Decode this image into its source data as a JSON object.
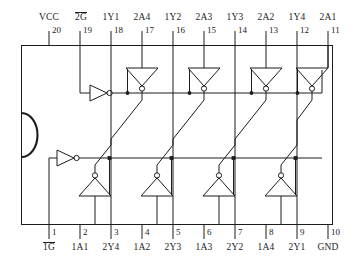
{
  "diagram": {
    "caption": "",
    "package": {
      "notch_name": "pin-1-notch",
      "outline_color": "#1c1c1c"
    }
  },
  "top_pins": [
    {
      "label": "VCC",
      "number": "20",
      "overbar": false
    },
    {
      "label": "2G",
      "number": "19",
      "overbar": true
    },
    {
      "label": "1Y1",
      "number": "18",
      "overbar": false
    },
    {
      "label": "2A4",
      "number": "17",
      "overbar": false
    },
    {
      "label": "1Y2",
      "number": "16",
      "overbar": false
    },
    {
      "label": "2A3",
      "number": "15",
      "overbar": false
    },
    {
      "label": "1Y3",
      "number": "14",
      "overbar": false
    },
    {
      "label": "2A2",
      "number": "13",
      "overbar": false
    },
    {
      "label": "1Y4",
      "number": "12",
      "overbar": false
    },
    {
      "label": "2A1",
      "number": "11",
      "overbar": false
    }
  ],
  "bottom_pins": [
    {
      "label": "1G",
      "number": "1",
      "overbar": true
    },
    {
      "label": "1A1",
      "number": "2",
      "overbar": false
    },
    {
      "label": "2Y4",
      "number": "3",
      "overbar": false
    },
    {
      "label": "1A2",
      "number": "4",
      "overbar": false
    },
    {
      "label": "2Y3",
      "number": "5",
      "overbar": false
    },
    {
      "label": "1A3",
      "number": "6",
      "overbar": false
    },
    {
      "label": "2Y2",
      "number": "7",
      "overbar": false
    },
    {
      "label": "1A4",
      "number": "8",
      "overbar": false
    },
    {
      "label": "2Y1",
      "number": "9",
      "overbar": false
    },
    {
      "label": "GND",
      "number": "10",
      "overbar": false
    }
  ],
  "gates": {
    "enable_buffers": [
      {
        "name": "enable-inverter-2g",
        "orientation": "right",
        "bubble": true
      },
      {
        "name": "enable-inverter-1g",
        "orientation": "right",
        "bubble": true
      }
    ],
    "top_row_buffers": [
      {
        "name": "tristate-buffer-2a4",
        "orientation": "down",
        "bubble": true
      },
      {
        "name": "tristate-buffer-2a3",
        "orientation": "down",
        "bubble": true
      },
      {
        "name": "tristate-buffer-2a2",
        "orientation": "down",
        "bubble": true
      },
      {
        "name": "tristate-buffer-2a1",
        "orientation": "down",
        "bubble": true
      }
    ],
    "bottom_row_buffers": [
      {
        "name": "tristate-buffer-1a1",
        "orientation": "up",
        "bubble": true
      },
      {
        "name": "tristate-buffer-1a2",
        "orientation": "up",
        "bubble": true
      },
      {
        "name": "tristate-buffer-1a3",
        "orientation": "up",
        "bubble": true
      },
      {
        "name": "tristate-buffer-1a4",
        "orientation": "up",
        "bubble": true
      }
    ]
  }
}
